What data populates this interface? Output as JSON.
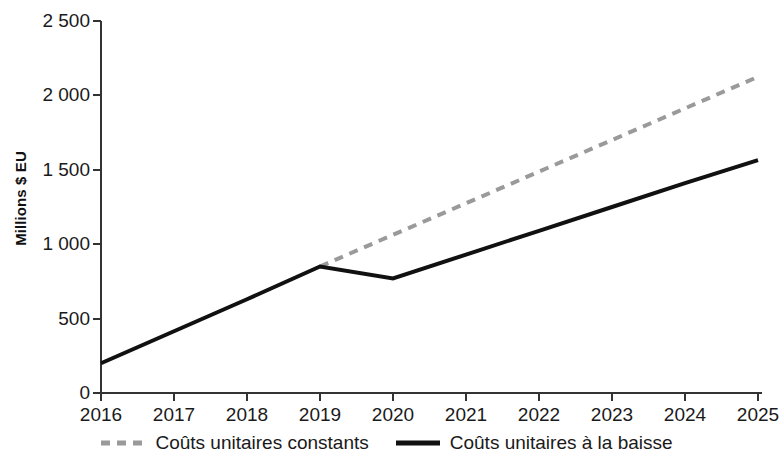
{
  "chart_data": {
    "type": "line",
    "title": "",
    "xlabel": "",
    "ylabel": "Millions $ EU",
    "x": [
      2016,
      2017,
      2018,
      2019,
      2020,
      2021,
      2022,
      2023,
      2024,
      2025
    ],
    "xtick_labels": [
      "2016",
      "2017",
      "2018",
      "2019",
      "2020",
      "2021",
      "2022",
      "2023",
      "2024",
      "2025"
    ],
    "ytick_labels": [
      "0",
      "500",
      "1 000",
      "1 500",
      "2 000",
      "2 500"
    ],
    "ytick_values": [
      0,
      500,
      1000,
      1500,
      2000,
      2500
    ],
    "xlim": [
      2016,
      2025
    ],
    "ylim": [
      0,
      2500
    ],
    "grid": false,
    "legend_position": "bottom-center",
    "series": [
      {
        "name": "Coûts unitaires constants",
        "style": "dashed",
        "color": "#9a9a9a",
        "x": [
          2019,
          2020,
          2021,
          2022,
          2023,
          2024,
          2025
        ],
        "values": [
          850,
          1063,
          1275,
          1488,
          1700,
          1913,
          2125
        ]
      },
      {
        "name": "Coûts unitaires à la baisse",
        "style": "solid",
        "color": "#111111",
        "x": [
          2016,
          2017,
          2018,
          2019,
          2020,
          2021,
          2022,
          2023,
          2024,
          2025
        ],
        "values": [
          200,
          415,
          630,
          850,
          770,
          930,
          1090,
          1250,
          1410,
          1565
        ]
      }
    ]
  },
  "axis": {
    "y_title": "Millions $ EU",
    "y_ticks": [
      "2 500",
      "2 000",
      "1 500",
      "1 000",
      "500",
      "0"
    ],
    "x_ticks": [
      "2016",
      "2017",
      "2018",
      "2019",
      "2020",
      "2021",
      "2022",
      "2023",
      "2024",
      "2025"
    ]
  },
  "legend": {
    "items": [
      {
        "label": "Coûts unitaires constants",
        "style": "dashed",
        "color": "#9a9a9a"
      },
      {
        "label": "Coûts unitaires à la baisse",
        "style": "solid",
        "color": "#111111"
      }
    ]
  },
  "colors": {
    "dashed_series": "#9a9a9a",
    "solid_series": "#111111",
    "axis": "#333333",
    "background": "#ffffff"
  }
}
